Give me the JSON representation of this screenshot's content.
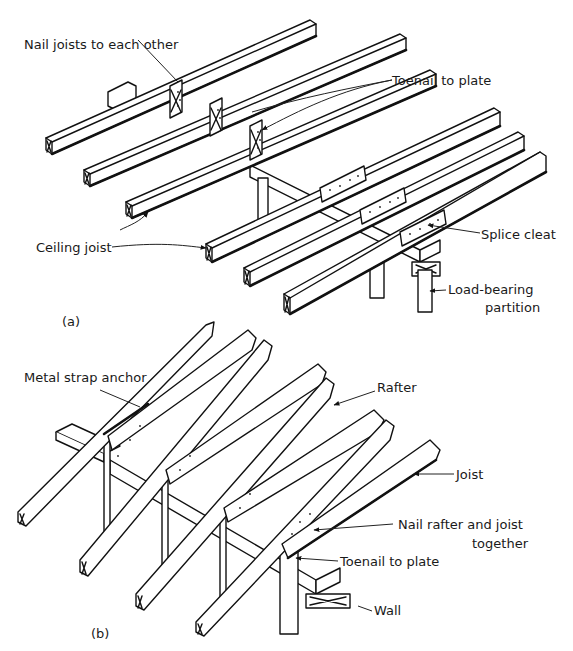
{
  "figure": {
    "part_a": {
      "caption": "(a)",
      "labels": {
        "nail_joists": "Nail joists to each other",
        "toenail_plate": "Toenail to plate",
        "ceiling_joist": "Ceiling joist",
        "splice_cleat": "Splice cleat",
        "load_bearing_1": "Load-bearing",
        "load_bearing_2": "partition"
      }
    },
    "part_b": {
      "caption": "(b)",
      "labels": {
        "metal_strap": "Metal strap anchor",
        "rafter": "Rafter",
        "joist": "Joist",
        "nail_rafter_1": "Nail rafter and joist",
        "nail_rafter_2": "together",
        "toenail_plate": "Toenail to plate",
        "wall": "Wall"
      }
    }
  }
}
